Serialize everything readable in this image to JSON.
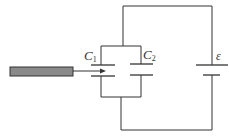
{
  "diagram": {
    "type": "circuit",
    "labels": {
      "c1": {
        "main": "C",
        "sub": "1"
      },
      "c2": {
        "main": "C",
        "sub": "2"
      },
      "emf": "ε"
    },
    "colors": {
      "wire": "#333333",
      "slab_fill": "#8a8a8a",
      "slab_stroke": "#333333",
      "background": "#ffffff"
    }
  }
}
